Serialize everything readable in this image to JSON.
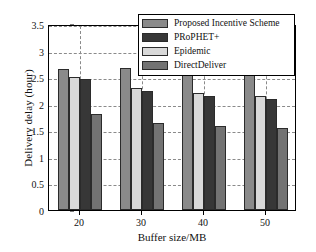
{
  "chart_data": {
    "type": "bar",
    "title": "",
    "xlabel": "Buffer size/MB",
    "ylabel": "Delivery delay (hour)",
    "categories": [
      "20",
      "30",
      "40",
      "50"
    ],
    "ylim": [
      0,
      3.5
    ],
    "yticks": [
      "0",
      "0.5",
      "1",
      "1.5",
      "2",
      "2.5",
      "3",
      "3.5"
    ],
    "ytick_values": [
      0,
      0.5,
      1,
      1.5,
      2,
      2.5,
      3,
      3.5
    ],
    "grid": "dashed both axes",
    "legend_position": "top-right inside",
    "plot_order": [
      "Proposed Incentive Scheme",
      "Epidemic",
      "PRoPHET+",
      "DirectDeliver"
    ],
    "series": [
      {
        "name": "Proposed Incentive Scheme",
        "color": "#8a8a8a",
        "values": [
          2.65,
          2.67,
          2.67,
          2.69
        ]
      },
      {
        "name": "PRoPHET+",
        "color": "#373737",
        "values": [
          2.46,
          2.24,
          2.14,
          2.08
        ]
      },
      {
        "name": "Epidemic",
        "color": "#d9d9d9",
        "values": [
          2.5,
          2.3,
          2.2,
          2.15
        ]
      },
      {
        "name": "DirectDeliver",
        "color": "#737373",
        "values": [
          1.8,
          1.63,
          1.59,
          1.54
        ]
      }
    ]
  },
  "legend": {
    "items": [
      {
        "label": "Proposed Incentive Scheme",
        "color": "#8a8a8a"
      },
      {
        "label": "PRoPHET+",
        "color": "#373737"
      },
      {
        "label": "Epidemic",
        "color": "#d9d9d9"
      },
      {
        "label": "DirectDeliver",
        "color": "#737373"
      }
    ]
  },
  "axes": {
    "y_title": "Delivery delay (hour)",
    "x_title": "Buffer size/MB"
  },
  "colors": {
    "axis": "#000000",
    "grid": "#8a8a8a",
    "background": "#ffffff",
    "text": "#111111"
  }
}
